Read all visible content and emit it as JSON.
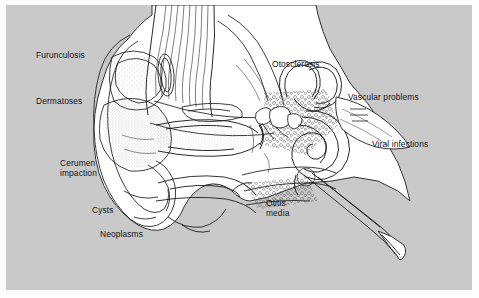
{
  "figure": {
    "kind": "anatomical-illustration",
    "background_color": "#c9c9c9",
    "page_color": "#fdfdfd",
    "line_color": "#1a1a1a",
    "fill_color": "#ffffff"
  },
  "labels": [
    {
      "id": "furunculosis",
      "text": "Furunculosis",
      "x": 36,
      "y": 50,
      "align": "left"
    },
    {
      "id": "dermatoses",
      "text": "Dermatoses",
      "x": 36,
      "y": 96,
      "align": "left"
    },
    {
      "id": "cerumen-impaction",
      "text": "Cerumen\nimpaction",
      "x": 60,
      "y": 158,
      "align": "left"
    },
    {
      "id": "cysts",
      "text": "Cysts",
      "x": 92,
      "y": 205,
      "align": "left"
    },
    {
      "id": "neoplasms",
      "text": "Neoplasms",
      "x": 100,
      "y": 229,
      "align": "left"
    },
    {
      "id": "otosclerosis",
      "text": "Otosclerosis",
      "x": 272,
      "y": 59,
      "align": "left"
    },
    {
      "id": "vascular-problems",
      "text": "Vascular problems",
      "x": 348,
      "y": 92,
      "align": "left"
    },
    {
      "id": "viral-infections",
      "text": "Viral infections",
      "x": 372,
      "y": 139,
      "align": "left"
    },
    {
      "id": "otitis-media",
      "text": "Otitis\nmedia",
      "x": 266,
      "y": 198,
      "align": "left"
    }
  ],
  "anatomy_parts": [
    "pinna",
    "auricle-helix",
    "concha",
    "external-auditory-canal",
    "tympanic-membrane",
    "ossicles-malleus-incus-stapes",
    "semicircular-canals",
    "cochlea",
    "vestibulocochlear-nerve",
    "eustachian-tube",
    "mastoid-air-cells",
    "temporal-bone",
    "temporalis-muscle-fibers",
    "parotid-region"
  ]
}
